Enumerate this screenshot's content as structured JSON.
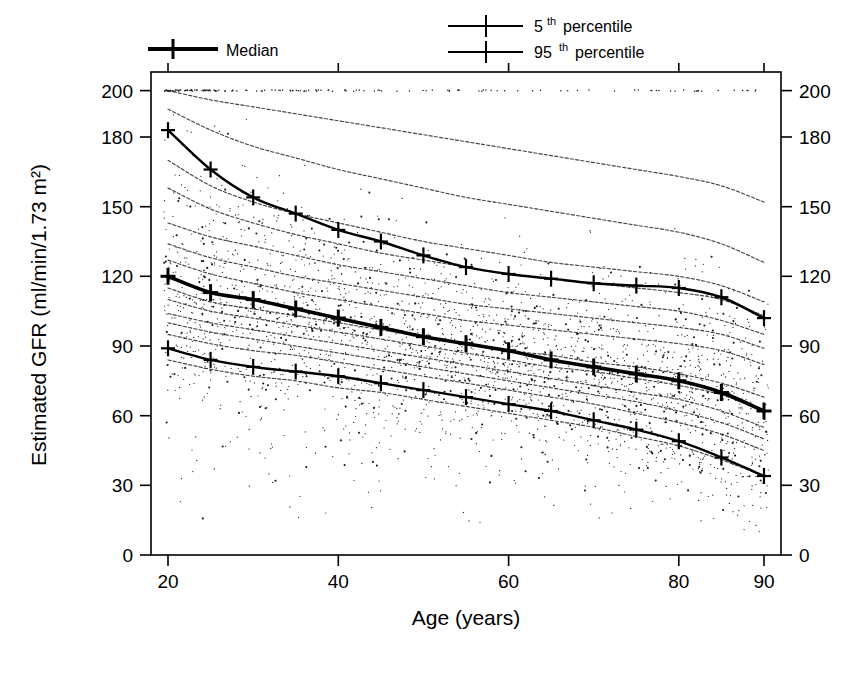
{
  "chart_data": {
    "type": "line",
    "title": "",
    "subtitle": "",
    "xlabel": "Age (years)",
    "ylabel": "Estimated GFR (ml/min/1.73 m²)",
    "xlim": [
      18,
      92
    ],
    "ylim": [
      0,
      208
    ],
    "grid": false,
    "legend_position": "top",
    "x_ticks": [
      20,
      40,
      60,
      80,
      90
    ],
    "x_tick_labels": [
      "20",
      "40",
      "60",
      "80",
      "90"
    ],
    "y_ticks": [
      0,
      30,
      60,
      90,
      120,
      150,
      180,
      200
    ],
    "y_tick_labels": [
      "0",
      "30",
      "60",
      "90",
      "120",
      "150",
      "180",
      "200"
    ],
    "y_axis_duplicated_right": true,
    "x": [
      20,
      25,
      30,
      35,
      40,
      45,
      50,
      55,
      60,
      65,
      70,
      75,
      80,
      85,
      90
    ],
    "series": [
      {
        "name": "95th percentile",
        "legend_label": "95",
        "legend_suffix": "th",
        "legend_tail": " percentile",
        "style": "solid",
        "marker": "plus",
        "linewidth": 2.4,
        "values": [
          183,
          166,
          154,
          147,
          140,
          135,
          129,
          124,
          121,
          119,
          117,
          116,
          115,
          111,
          102
        ]
      },
      {
        "name": "Median",
        "legend_label": "Median",
        "style": "solid-bold",
        "marker": "plus",
        "linewidth": 3.6,
        "values": [
          120,
          113,
          110,
          106,
          102,
          98,
          94,
          91,
          88,
          84,
          81,
          78,
          75,
          70,
          62
        ]
      },
      {
        "name": "5th percentile",
        "legend_label": "5",
        "legend_suffix": "th",
        "legend_tail": " percentile",
        "style": "solid",
        "marker": "plus",
        "linewidth": 2.4,
        "values": [
          89,
          84,
          81,
          79,
          77,
          74,
          71,
          68,
          65,
          62,
          58,
          54,
          49,
          42,
          34
        ]
      }
    ],
    "background_curves": [
      {
        "name": "upper-decile-1",
        "values": [
          200,
          196,
          193,
          190,
          187,
          184,
          181,
          178,
          175,
          172,
          169,
          166,
          163,
          159,
          152
        ]
      },
      {
        "name": "upper-decile-2",
        "values": [
          192,
          183,
          176,
          171,
          166,
          162,
          158,
          154,
          151,
          148,
          145,
          142,
          139,
          134,
          126
        ]
      },
      {
        "name": "upper-decile-3",
        "values": [
          170,
          159,
          152,
          147,
          143,
          139,
          135,
          132,
          129,
          126,
          124,
          122,
          120,
          116,
          109
        ]
      },
      {
        "name": "upper-decile-4",
        "values": [
          158,
          149,
          143,
          138,
          134,
          130,
          127,
          124,
          121,
          119,
          117,
          115,
          113,
          110,
          103
        ]
      },
      {
        "name": "upper-decile-5",
        "values": [
          143,
          137,
          133,
          129,
          125,
          122,
          119,
          116,
          113,
          111,
          109,
          107,
          105,
          101,
          95
        ]
      },
      {
        "name": "upper-decile-6",
        "values": [
          134,
          128,
          124,
          120,
          117,
          114,
          111,
          108,
          106,
          104,
          102,
          100,
          98,
          95,
          89
        ]
      },
      {
        "name": "mid-decile-1",
        "values": [
          127,
          121,
          117,
          113,
          110,
          107,
          104,
          101,
          99,
          97,
          95,
          93,
          91,
          88,
          82
        ]
      },
      {
        "name": "mid-decile-2",
        "values": [
          115,
          109,
          106,
          103,
          100,
          97,
          94,
          91,
          88,
          86,
          83,
          81,
          78,
          74,
          68
        ]
      },
      {
        "name": "mid-decile-3",
        "values": [
          110,
          105,
          102,
          99,
          96,
          93,
          90,
          87,
          84,
          81,
          79,
          76,
          73,
          69,
          62
        ]
      },
      {
        "name": "mid-decile-4",
        "values": [
          104,
          100,
          97,
          94,
          91,
          88,
          85,
          82,
          79,
          76,
          73,
          70,
          67,
          62,
          55
        ]
      },
      {
        "name": "mid-decile-5",
        "values": [
          100,
          96,
          93,
          90,
          87,
          84,
          81,
          78,
          75,
          72,
          69,
          66,
          62,
          57,
          50
        ]
      },
      {
        "name": "lower-decile-1",
        "values": [
          95,
          91,
          88,
          86,
          83,
          80,
          77,
          74,
          71,
          68,
          65,
          61,
          57,
          52,
          45
        ]
      },
      {
        "name": "lower-decile-2",
        "values": [
          84,
          80,
          77,
          75,
          72,
          70,
          67,
          64,
          61,
          58,
          55,
          51,
          47,
          41,
          34
        ]
      }
    ],
    "scatter": {
      "description": "individual subject estimated GFR values",
      "marker": "point",
      "n_visible_approx": 1400,
      "capped_band_at": 200
    },
    "annotations": []
  },
  "legend": {
    "entries": [
      {
        "id": "median",
        "label": "Median",
        "sup": "",
        "tail": "",
        "line_weight": "bold"
      },
      {
        "id": "p5",
        "label": "5",
        "sup": "th",
        "tail": " percentile",
        "line_weight": "normal"
      },
      {
        "id": "p95",
        "label": "95",
        "sup": "th",
        "tail": " percentile",
        "line_weight": "normal"
      }
    ]
  },
  "caption": {
    "partial_text": "cut-off caption line at bottom edge"
  }
}
